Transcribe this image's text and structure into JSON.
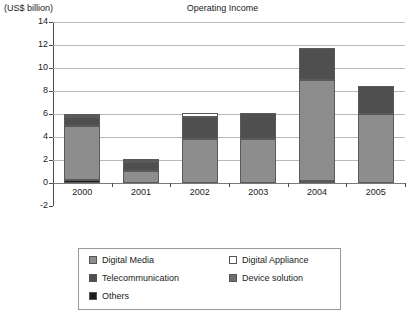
{
  "chart_data": {
    "type": "bar",
    "subtype": "stacked-bar",
    "title": "Operating Income",
    "xlabel": "",
    "ylabel": "(US$ billion)",
    "unit_label": "(US$ billion)",
    "ylim": [
      -2,
      14
    ],
    "ytick_step": 2,
    "yticks": [
      14,
      12,
      10,
      8,
      6,
      4,
      2,
      0,
      -2
    ],
    "categories": [
      "2000",
      "2001",
      "2002",
      "2003",
      "2004",
      "2005"
    ],
    "grid": "horizontal",
    "legend_position": "bottom",
    "series": [
      {
        "name": "Others",
        "color": "#1c1c1c",
        "values": [
          0.25,
          0.0,
          0.0,
          0.0,
          0.2,
          0.0
        ]
      },
      {
        "name": "Digital Media",
        "color": "#8d8d8d",
        "values": [
          4.75,
          1.05,
          3.8,
          3.85,
          8.8,
          6.0
        ]
      },
      {
        "name": "Telecommunication",
        "color": "#4f4f4f",
        "values": [
          0.75,
          0.75,
          1.9,
          2.25,
          2.7,
          2.4
        ]
      },
      {
        "name": "Digital Appliance",
        "color": "#ffffff",
        "values": [
          0.12,
          0.12,
          0.35,
          0.0,
          0.0,
          0.0
        ]
      },
      {
        "name": "Device solution",
        "color": "#6e6e6e",
        "values": [
          0.13,
          0.13,
          0.0,
          0.0,
          0.0,
          0.0
        ]
      }
    ],
    "totals": [
      6.0,
      2.05,
      6.05,
      6.1,
      11.7,
      8.4
    ],
    "annotations": []
  },
  "legend": {
    "items": [
      {
        "label": "Digital Media",
        "color": "#8d8d8d"
      },
      {
        "label": "Digital Appliance",
        "color": "#ffffff"
      },
      {
        "label": "Telecommunication",
        "color": "#4f4f4f"
      },
      {
        "label": "Device solution",
        "color": "#6e6e6e"
      },
      {
        "label": "Others",
        "color": "#1c1c1c"
      }
    ]
  },
  "colors": {
    "grid": "#b8b8b8",
    "axis": "#4d4d4d",
    "text": "#1a1a1a",
    "background": "#ffffff"
  }
}
